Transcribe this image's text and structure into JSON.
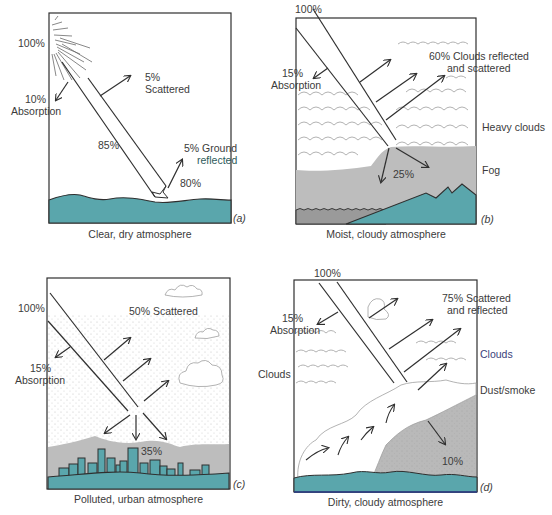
{
  "colors": {
    "water": "#5aa6ac",
    "fog": "#bdbdbd",
    "dust": "#b9b9b9",
    "stroke": "#2f2f2f",
    "text": "#3b3b3b",
    "cloud_outline": "#9a9a9a"
  },
  "panels": [
    {
      "id": "a",
      "tag": "(a)",
      "caption": "Clear, dry atmosphere",
      "labels": {
        "incoming": "100%",
        "scattered_pct": "5%",
        "scattered": "Scattered",
        "absorption_pct": "10%",
        "absorption": "Absorption",
        "transmitted": "85%",
        "ground_reflected_1": "5% Ground",
        "ground_reflected_2": "reflected",
        "absorbed_ground": "80%"
      }
    },
    {
      "id": "b",
      "tag": "(b)",
      "caption": "Moist, cloudy atmosphere",
      "labels": {
        "incoming": "100%",
        "absorption_pct": "15%",
        "absorption": "Absorption",
        "reflected_1": "60% Clouds reflected",
        "reflected_2": "and scattered",
        "heavy_clouds": "Heavy clouds",
        "fog": "Fog",
        "transmitted": "25%"
      }
    },
    {
      "id": "c",
      "tag": "(c)",
      "caption": "Polluted, urban atmosphere",
      "labels": {
        "incoming": "100%",
        "scattered": "50% Scattered",
        "absorption_pct": "15%",
        "absorption": "Absorption",
        "transmitted": "35%"
      }
    },
    {
      "id": "d",
      "tag": "(d)",
      "caption": "Dirty, cloudy atmosphere",
      "labels": {
        "incoming": "100%",
        "absorption_pct": "15%",
        "absorption": "Absorption",
        "scattered_1": "75% Scattered",
        "scattered_2": "and reflected",
        "clouds_left": "Clouds",
        "clouds_right": "Clouds",
        "dust_smoke": "Dust/smoke",
        "transmitted": "10%"
      }
    }
  ]
}
